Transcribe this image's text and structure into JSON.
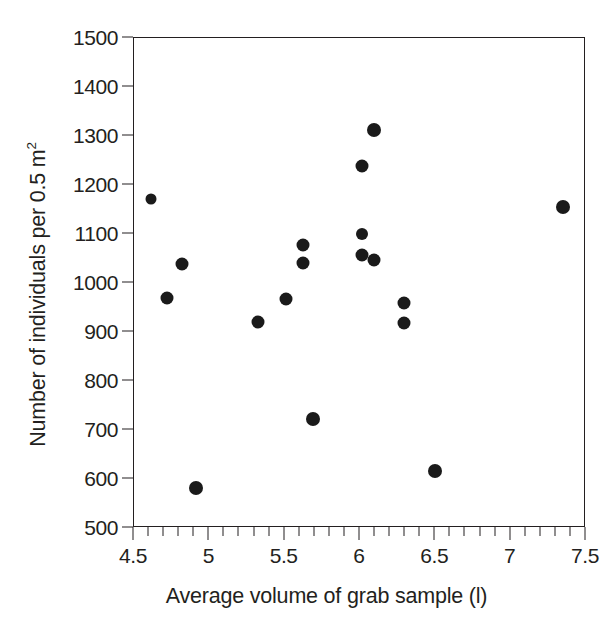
{
  "chart_data": {
    "type": "scatter",
    "title": "",
    "xlabel": "Average volume of grab sample (l)",
    "ylabel_parts": {
      "before": "Number of individuals per 0.5 m",
      "superscript": "2"
    },
    "ylabel": "Number of individuals per 0.5 m2",
    "xlim": [
      4.5,
      7.5
    ],
    "ylim": [
      500,
      1500
    ],
    "grid": false,
    "legend": null,
    "x_major_ticks": [
      4.5,
      5,
      5.5,
      6,
      6.5,
      7,
      7.5
    ],
    "x_major_tick_labels": [
      "4.5",
      "5",
      "5.5",
      "6",
      "6.5",
      "7",
      "7.5"
    ],
    "x_minor_tick_step": 0.1,
    "y_major_ticks": [
      500,
      600,
      700,
      800,
      900,
      1000,
      1100,
      1200,
      1300,
      1400,
      1500
    ],
    "y_major_tick_labels": [
      "500",
      "600",
      "700",
      "800",
      "900",
      "1000",
      "1100",
      "1200",
      "1300",
      "1400",
      "1500"
    ],
    "marker": {
      "shape": "circle",
      "color": "#1a1a1a",
      "size_px": 13,
      "small_size_px": 11
    },
    "points": [
      {
        "x": 4.61,
        "y": 1172,
        "r": 5.5
      },
      {
        "x": 4.72,
        "y": 970,
        "r": 6.5
      },
      {
        "x": 4.82,
        "y": 1039,
        "r": 6.5
      },
      {
        "x": 4.91,
        "y": 582,
        "r": 7.0
      },
      {
        "x": 5.32,
        "y": 921,
        "r": 6.5
      },
      {
        "x": 5.51,
        "y": 967,
        "r": 6.5
      },
      {
        "x": 5.62,
        "y": 1077,
        "r": 6.5
      },
      {
        "x": 5.62,
        "y": 1041,
        "r": 6.5
      },
      {
        "x": 5.69,
        "y": 722,
        "r": 7.0
      },
      {
        "x": 6.01,
        "y": 1100,
        "r": 6.0
      },
      {
        "x": 6.01,
        "y": 1057,
        "r": 6.5
      },
      {
        "x": 6.01,
        "y": 1239,
        "r": 6.5
      },
      {
        "x": 6.09,
        "y": 1046,
        "r": 6.5
      },
      {
        "x": 6.09,
        "y": 1313,
        "r": 7.0
      },
      {
        "x": 6.29,
        "y": 960,
        "r": 6.5
      },
      {
        "x": 6.29,
        "y": 918,
        "r": 6.5
      },
      {
        "x": 6.5,
        "y": 617,
        "r": 7.0
      },
      {
        "x": 7.35,
        "y": 1155,
        "r": 7.0
      }
    ]
  }
}
